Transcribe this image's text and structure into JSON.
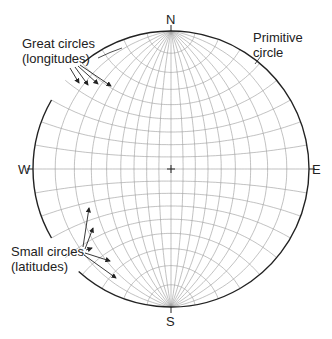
{
  "directions": {
    "north": "N",
    "south": "S",
    "east": "E",
    "west": "W"
  },
  "annotations": {
    "great_circles": {
      "line1": "Great circles",
      "line2": "(longitudes)"
    },
    "primitive_circle": {
      "line1": "Primitive",
      "line2": "circle"
    },
    "small_circles": {
      "line1": "Small circles",
      "line2": "(latitudes)"
    }
  },
  "net": {
    "center_x": 171,
    "center_y": 169,
    "radius": 138,
    "interval_deg": 10,
    "line_color": "#999999",
    "primitive_color": "#222222"
  }
}
